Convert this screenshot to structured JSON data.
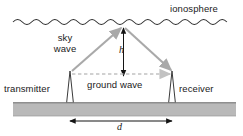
{
  "diagram": {
    "labels": {
      "ionosphere": "ionosphere",
      "sky_wave_line1": "sky",
      "sky_wave_line2": "wave",
      "ground_wave": "ground wave",
      "transmitter": "transmitter",
      "receiver": "receiver",
      "height_symbol": "h",
      "distance_symbol": "d"
    },
    "colors": {
      "ground_fill": "#b9b9b9",
      "ground_edge": "#6e6e6e",
      "ray_arrow": "#a9a9a9",
      "dashed_arrow": "#bdbdbd",
      "dimension_line": "#1a1a1a",
      "wavy_line": "#2b2b2b",
      "text": "#1a1a1a"
    },
    "geometry": {
      "ionosphere_y": 22,
      "ionosphere_x_start": 13,
      "ionosphere_x_end": 236,
      "apex_x": 123,
      "apex_y": 25,
      "transmitter_x": 70,
      "receiver_x": 172,
      "antenna_top_y": 72,
      "ground_top_y": 102,
      "ground_bottom_y": 116,
      "height_arrow_top_y": 26,
      "height_arrow_bottom_y": 77,
      "distance_arrow_y": 119
    },
    "elements": [
      "ionosphere-wavy-line",
      "sky-wave-up-ray",
      "sky-wave-down-ray",
      "height-dimension-arrow",
      "ground-wave-dashed-arrow",
      "transmitter-antenna",
      "receiver-antenna",
      "ground-band",
      "distance-dimension-arrow"
    ]
  }
}
